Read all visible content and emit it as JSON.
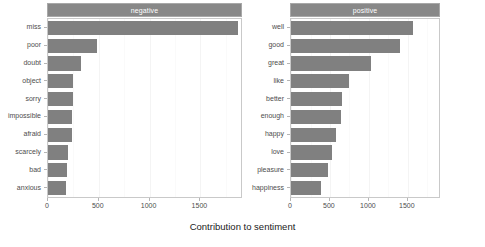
{
  "chart_data": {
    "type": "bar",
    "title": "",
    "xlabel": "Contribution to sentiment",
    "ylabel": "",
    "orientation": "horizontal",
    "grid": true,
    "legend": false,
    "facets": [
      {
        "label": "negative",
        "xlim": [
          0,
          1900
        ],
        "xticks": [
          0,
          500,
          1000,
          1500
        ],
        "xticklabels": [
          "0",
          "500",
          "1000",
          "1500"
        ],
        "categories": [
          "miss",
          "poor",
          "doubt",
          "object",
          "sorry",
          "impossible",
          "afraid",
          "scarcely",
          "bad",
          "anxious"
        ],
        "values": [
          1870,
          480,
          320,
          250,
          245,
          240,
          235,
          195,
          190,
          180
        ]
      },
      {
        "label": "positive",
        "xlim": [
          0,
          1900
        ],
        "xticks": [
          0,
          500,
          1000,
          1500
        ],
        "xticklabels": [
          "0",
          "500",
          "1000",
          "1500"
        ],
        "categories": [
          "well",
          "good",
          "great",
          "like",
          "better",
          "enough",
          "happy",
          "love",
          "pleasure",
          "happiness"
        ],
        "values": [
          1565,
          1400,
          1020,
          750,
          660,
          640,
          580,
          520,
          480,
          380
        ]
      }
    ],
    "colors": {
      "bar_fill": "#808080",
      "strip_background": "#888888",
      "strip_text": "#ffffff",
      "panel_background": "#ffffff",
      "panel_border": "#c9c9c9",
      "gridline": "#f4f4f4",
      "tick_text": "#4d4d4d",
      "axis_title_text": "#1a1a1a"
    }
  }
}
